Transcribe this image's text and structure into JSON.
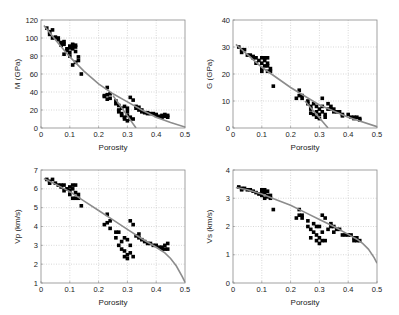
{
  "figure": {
    "background": "#ffffff",
    "frame_color": "#8a8a8a",
    "grid_color": "#bdbdbd",
    "marker_color": "#000000",
    "curve_color": "#8c8c8c"
  },
  "chart_data": [
    {
      "type": "scatter",
      "id": "M",
      "title": "",
      "xlabel": "Porosity",
      "ylabel": "M (GPa)",
      "xlim": [
        0,
        0.5
      ],
      "ylim": [
        0,
        120
      ],
      "xticks": [
        0,
        0.1,
        0.2,
        0.3,
        0.4,
        0.5
      ],
      "xtick_labels": [
        "0",
        "0.1",
        "0.2",
        "0.3",
        "0.4",
        "0.5"
      ],
      "yticks": [
        0,
        20,
        40,
        60,
        80,
        100,
        120
      ],
      "ytick_labels": [
        "0",
        "20",
        "40",
        "60",
        "80",
        "100",
        "120"
      ],
      "grid": true,
      "frame": {
        "left": 41,
        "top": 20,
        "right": 185,
        "bottom": 128
      },
      "points": [
        [
          0.02,
          111
        ],
        [
          0.03,
          107
        ],
        [
          0.03,
          104
        ],
        [
          0.04,
          109
        ],
        [
          0.04,
          100
        ],
        [
          0.05,
          101
        ],
        [
          0.06,
          100
        ],
        [
          0.06,
          98
        ],
        [
          0.07,
          95
        ],
        [
          0.07,
          94
        ],
        [
          0.08,
          96
        ],
        [
          0.08,
          93
        ],
        [
          0.07,
          92
        ],
        [
          0.09,
          88
        ],
        [
          0.09,
          86
        ],
        [
          0.1,
          89
        ],
        [
          0.1,
          91
        ],
        [
          0.1,
          84
        ],
        [
          0.1,
          80
        ],
        [
          0.11,
          93
        ],
        [
          0.11,
          88
        ],
        [
          0.11,
          92
        ],
        [
          0.12,
          92
        ],
        [
          0.12,
          90
        ],
        [
          0.12,
          85
        ],
        [
          0.13,
          79
        ],
        [
          0.13,
          75
        ],
        [
          0.12,
          73
        ],
        [
          0.11,
          70
        ],
        [
          0.08,
          82
        ],
        [
          0.14,
          60
        ],
        [
          0.22,
          36
        ],
        [
          0.22,
          35
        ],
        [
          0.23,
          37
        ],
        [
          0.23,
          45
        ],
        [
          0.24,
          38
        ],
        [
          0.24,
          33
        ],
        [
          0.23,
          32
        ],
        [
          0.26,
          30
        ],
        [
          0.26,
          27
        ],
        [
          0.27,
          25
        ],
        [
          0.27,
          20
        ],
        [
          0.27,
          18
        ],
        [
          0.28,
          22
        ],
        [
          0.28,
          14
        ],
        [
          0.28,
          16
        ],
        [
          0.29,
          12
        ],
        [
          0.29,
          10
        ],
        [
          0.29,
          24
        ],
        [
          0.3,
          22
        ],
        [
          0.3,
          18
        ],
        [
          0.3,
          14
        ],
        [
          0.3,
          8
        ],
        [
          0.31,
          12
        ],
        [
          0.31,
          10
        ],
        [
          0.31,
          34
        ],
        [
          0.32,
          10
        ],
        [
          0.32,
          31
        ],
        [
          0.33,
          24
        ],
        [
          0.33,
          22
        ],
        [
          0.34,
          23
        ],
        [
          0.34,
          20
        ],
        [
          0.35,
          20
        ],
        [
          0.35,
          18
        ],
        [
          0.36,
          17
        ],
        [
          0.37,
          17
        ],
        [
          0.37,
          16
        ],
        [
          0.38,
          16
        ],
        [
          0.39,
          16
        ],
        [
          0.4,
          15
        ],
        [
          0.4,
          14
        ],
        [
          0.41,
          13
        ],
        [
          0.42,
          14
        ],
        [
          0.42,
          12
        ],
        [
          0.43,
          13
        ],
        [
          0.43,
          15
        ],
        [
          0.44,
          12
        ],
        [
          0.44,
          14
        ]
      ],
      "curves": [
        {
          "name": "trend",
          "x": [
            0.01,
            0.05,
            0.1,
            0.15,
            0.2,
            0.25,
            0.3,
            0.35,
            0.4,
            0.45,
            0.5
          ],
          "y": [
            114,
            98,
            79,
            63,
            49,
            38,
            29,
            20,
            12,
            6,
            1
          ]
        },
        {
          "name": "steep",
          "x": [
            0.25,
            0.33
          ],
          "y": [
            36,
            0
          ]
        }
      ]
    },
    {
      "type": "scatter",
      "id": "G",
      "title": "",
      "xlabel": "Porosity",
      "ylabel": "G (GPa)",
      "xlim": [
        0,
        0.5
      ],
      "ylim": [
        0,
        40
      ],
      "xticks": [
        0,
        0.1,
        0.2,
        0.3,
        0.4,
        0.5
      ],
      "xtick_labels": [
        "0",
        "0.1",
        "0.2",
        "0.3",
        "0.4",
        "0.5"
      ],
      "yticks": [
        0,
        10,
        20,
        30,
        40
      ],
      "ytick_labels": [
        "0",
        "10",
        "20",
        "30",
        "40"
      ],
      "grid": true,
      "frame": {
        "left": 233,
        "top": 20,
        "right": 377,
        "bottom": 128
      },
      "points": [
        [
          0.02,
          30
        ],
        [
          0.03,
          29
        ],
        [
          0.03,
          28
        ],
        [
          0.04,
          29
        ],
        [
          0.05,
          27
        ],
        [
          0.06,
          27
        ],
        [
          0.07,
          26
        ],
        [
          0.07,
          26.5
        ],
        [
          0.08,
          26
        ],
        [
          0.08,
          24
        ],
        [
          0.09,
          25
        ],
        [
          0.1,
          26
        ],
        [
          0.1,
          24
        ],
        [
          0.1,
          22
        ],
        [
          0.1,
          21
        ],
        [
          0.11,
          26
        ],
        [
          0.11,
          25
        ],
        [
          0.11,
          23
        ],
        [
          0.12,
          26
        ],
        [
          0.12,
          24
        ],
        [
          0.12,
          21
        ],
        [
          0.13,
          22
        ],
        [
          0.13,
          21
        ],
        [
          0.12,
          23
        ],
        [
          0.14,
          15.5
        ],
        [
          0.22,
          11
        ],
        [
          0.23,
          12
        ],
        [
          0.23,
          14
        ],
        [
          0.24,
          12
        ],
        [
          0.24,
          11
        ],
        [
          0.26,
          10
        ],
        [
          0.26,
          9
        ],
        [
          0.27,
          8
        ],
        [
          0.27,
          7
        ],
        [
          0.27,
          5.5
        ],
        [
          0.28,
          9
        ],
        [
          0.28,
          5
        ],
        [
          0.29,
          8
        ],
        [
          0.29,
          4
        ],
        [
          0.29,
          6
        ],
        [
          0.3,
          7
        ],
        [
          0.3,
          5
        ],
        [
          0.3,
          3.5
        ],
        [
          0.31,
          8
        ],
        [
          0.31,
          6
        ],
        [
          0.31,
          11
        ],
        [
          0.32,
          4
        ],
        [
          0.32,
          5
        ],
        [
          0.33,
          9
        ],
        [
          0.33,
          7
        ],
        [
          0.34,
          7
        ],
        [
          0.34,
          8
        ],
        [
          0.35,
          7
        ],
        [
          0.35,
          6
        ],
        [
          0.36,
          6
        ],
        [
          0.37,
          6
        ],
        [
          0.38,
          5
        ],
        [
          0.38,
          4.5
        ],
        [
          0.4,
          5
        ],
        [
          0.41,
          4
        ],
        [
          0.42,
          4
        ],
        [
          0.42,
          3.5
        ],
        [
          0.43,
          4
        ],
        [
          0.44,
          3.5
        ],
        [
          0.44,
          3
        ]
      ],
      "curves": [
        {
          "name": "trend",
          "x": [
            0.01,
            0.1,
            0.2,
            0.3,
            0.4,
            0.5
          ],
          "y": [
            31,
            22.5,
            15,
            8.5,
            4,
            0.5
          ]
        },
        {
          "name": "steep",
          "x": [
            0.25,
            0.33
          ],
          "y": [
            10,
            0
          ]
        }
      ]
    },
    {
      "type": "scatter",
      "id": "Vp",
      "title": "",
      "xlabel": "Porosity",
      "ylabel": "Vp (km/s)",
      "xlim": [
        0,
        0.5
      ],
      "ylim": [
        1,
        7
      ],
      "xticks": [
        0,
        0.1,
        0.2,
        0.3,
        0.4,
        0.5
      ],
      "xtick_labels": [
        "0",
        "0.1",
        "0.2",
        "0.3",
        "0.4",
        "0.5"
      ],
      "yticks": [
        1,
        2,
        3,
        4,
        5,
        6,
        7
      ],
      "ytick_labels": [
        "1",
        "2",
        "3",
        "4",
        "5",
        "6",
        "7"
      ],
      "grid": true,
      "frame": {
        "left": 41,
        "top": 170,
        "right": 185,
        "bottom": 283
      },
      "points": [
        [
          0.02,
          6.5
        ],
        [
          0.03,
          6.4
        ],
        [
          0.03,
          6.3
        ],
        [
          0.04,
          6.5
        ],
        [
          0.05,
          6.3
        ],
        [
          0.06,
          6.2
        ],
        [
          0.07,
          6.2
        ],
        [
          0.07,
          6.1
        ],
        [
          0.08,
          6.2
        ],
        [
          0.08,
          5.9
        ],
        [
          0.09,
          6.0
        ],
        [
          0.1,
          6.1
        ],
        [
          0.1,
          5.9
        ],
        [
          0.1,
          5.7
        ],
        [
          0.11,
          6.2
        ],
        [
          0.11,
          6.0
        ],
        [
          0.11,
          5.5
        ],
        [
          0.12,
          6.2
        ],
        [
          0.12,
          5.8
        ],
        [
          0.13,
          5.7
        ],
        [
          0.13,
          5.5
        ],
        [
          0.12,
          5.5
        ],
        [
          0.14,
          5.1
        ],
        [
          0.22,
          4.1
        ],
        [
          0.23,
          4.2
        ],
        [
          0.23,
          4.65
        ],
        [
          0.24,
          4.3
        ],
        [
          0.24,
          3.9
        ],
        [
          0.26,
          3.7
        ],
        [
          0.26,
          3.4
        ],
        [
          0.27,
          3.0
        ],
        [
          0.27,
          3.7
        ],
        [
          0.28,
          3.2
        ],
        [
          0.28,
          2.8
        ],
        [
          0.29,
          3.4
        ],
        [
          0.29,
          2.4
        ],
        [
          0.29,
          2.7
        ],
        [
          0.3,
          3.3
        ],
        [
          0.3,
          2.3
        ],
        [
          0.3,
          2.5
        ],
        [
          0.31,
          3.0
        ],
        [
          0.31,
          2.6
        ],
        [
          0.31,
          4.3
        ],
        [
          0.32,
          2.4
        ],
        [
          0.32,
          4.1
        ],
        [
          0.33,
          3.5
        ],
        [
          0.34,
          3.6
        ],
        [
          0.34,
          3.4
        ],
        [
          0.35,
          3.3
        ],
        [
          0.36,
          3.2
        ],
        [
          0.37,
          3.1
        ],
        [
          0.38,
          3.1
        ],
        [
          0.39,
          3.0
        ],
        [
          0.4,
          3.0
        ],
        [
          0.41,
          2.9
        ],
        [
          0.42,
          2.9
        ],
        [
          0.42,
          2.8
        ],
        [
          0.43,
          3.0
        ],
        [
          0.43,
          2.8
        ],
        [
          0.44,
          3.1
        ],
        [
          0.44,
          2.8
        ]
      ],
      "curves": [
        {
          "name": "trend",
          "x": [
            0.01,
            0.05,
            0.1,
            0.15,
            0.2,
            0.25,
            0.3,
            0.35,
            0.4,
            0.43,
            0.45,
            0.47,
            0.49,
            0.5
          ],
          "y": [
            6.55,
            6.25,
            5.85,
            5.35,
            4.85,
            4.35,
            3.85,
            3.35,
            2.9,
            2.6,
            2.3,
            1.9,
            1.35,
            1.05
          ]
        }
      ]
    },
    {
      "type": "scatter",
      "id": "Vs",
      "title": "",
      "xlabel": "Porosity",
      "ylabel": "Vs (km/s)",
      "xlim": [
        0,
        0.5
      ],
      "ylim": [
        0,
        4
      ],
      "xticks": [
        0,
        0.1,
        0.2,
        0.3,
        0.4,
        0.5
      ],
      "xtick_labels": [
        "0",
        "0.1",
        "0.2",
        "0.3",
        "0.4",
        "0.5"
      ],
      "yticks": [
        0,
        1,
        2,
        3,
        4
      ],
      "ytick_labels": [
        "0",
        "1",
        "2",
        "3",
        "4"
      ],
      "grid": true,
      "frame": {
        "left": 233,
        "top": 170,
        "right": 377,
        "bottom": 283
      },
      "points": [
        [
          0.02,
          3.4
        ],
        [
          0.03,
          3.35
        ],
        [
          0.03,
          3.3
        ],
        [
          0.04,
          3.35
        ],
        [
          0.05,
          3.3
        ],
        [
          0.06,
          3.3
        ],
        [
          0.07,
          3.25
        ],
        [
          0.08,
          3.2
        ],
        [
          0.09,
          3.15
        ],
        [
          0.1,
          3.3
        ],
        [
          0.1,
          3.2
        ],
        [
          0.1,
          3.1
        ],
        [
          0.11,
          3.3
        ],
        [
          0.11,
          3.2
        ],
        [
          0.11,
          3.0
        ],
        [
          0.12,
          3.25
        ],
        [
          0.12,
          3.1
        ],
        [
          0.13,
          3.1
        ],
        [
          0.13,
          3.0
        ],
        [
          0.12,
          3.05
        ],
        [
          0.14,
          2.6
        ],
        [
          0.22,
          2.3
        ],
        [
          0.23,
          2.4
        ],
        [
          0.23,
          2.6
        ],
        [
          0.24,
          2.4
        ],
        [
          0.24,
          2.3
        ],
        [
          0.26,
          2.2
        ],
        [
          0.26,
          2.0
        ],
        [
          0.27,
          1.9
        ],
        [
          0.27,
          1.6
        ],
        [
          0.28,
          2.1
        ],
        [
          0.28,
          1.8
        ],
        [
          0.29,
          2.0
        ],
        [
          0.29,
          1.5
        ],
        [
          0.29,
          1.7
        ],
        [
          0.3,
          2.0
        ],
        [
          0.3,
          1.4
        ],
        [
          0.3,
          1.6
        ],
        [
          0.31,
          1.8
        ],
        [
          0.31,
          1.5
        ],
        [
          0.31,
          2.4
        ],
        [
          0.32,
          1.5
        ],
        [
          0.32,
          2.3
        ],
        [
          0.33,
          1.9
        ],
        [
          0.34,
          2.1
        ],
        [
          0.34,
          2.0
        ],
        [
          0.35,
          1.8
        ],
        [
          0.35,
          2.0
        ],
        [
          0.36,
          1.9
        ],
        [
          0.37,
          1.9
        ],
        [
          0.38,
          1.7
        ],
        [
          0.39,
          1.7
        ],
        [
          0.4,
          1.7
        ],
        [
          0.41,
          1.7
        ],
        [
          0.42,
          1.6
        ],
        [
          0.42,
          1.5
        ],
        [
          0.43,
          1.6
        ],
        [
          0.43,
          1.5
        ],
        [
          0.44,
          1.5
        ]
      ],
      "curves": [
        {
          "name": "trend",
          "x": [
            0.01,
            0.05,
            0.1,
            0.15,
            0.2,
            0.25,
            0.3,
            0.35,
            0.4,
            0.43,
            0.45,
            0.47,
            0.49,
            0.5
          ],
          "y": [
            3.38,
            3.3,
            3.15,
            2.95,
            2.75,
            2.5,
            2.25,
            2.0,
            1.72,
            1.55,
            1.4,
            1.2,
            0.9,
            0.7
          ]
        }
      ]
    }
  ]
}
